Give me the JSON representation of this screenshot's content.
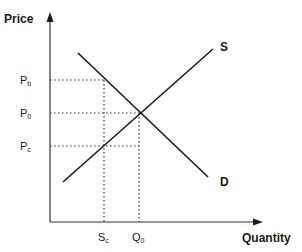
{
  "diagram": {
    "type": "supply-demand",
    "y_axis_label": "Price",
    "x_axis_label": "Quantity",
    "curves": [
      {
        "name": "S",
        "label": "S",
        "description": "Supply curve (upward sloping)"
      },
      {
        "name": "D",
        "label": "D",
        "description": "Demand curve (downward sloping)"
      }
    ],
    "price_levels": [
      {
        "base": "P",
        "sub": "b"
      },
      {
        "base": "P",
        "sub": "0"
      },
      {
        "base": "P",
        "sub": "c"
      }
    ],
    "quantity_levels": [
      {
        "base": "S",
        "sub": "c"
      },
      {
        "base": "Q",
        "sub": "0"
      }
    ],
    "colors": {
      "line": "#1a1a1a",
      "background": "#ffffff"
    }
  }
}
